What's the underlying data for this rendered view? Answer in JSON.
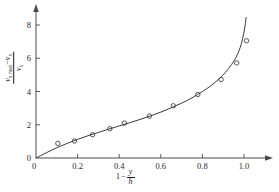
{
  "chart_data": {
    "type": "scatter",
    "title": "",
    "subtitle": "",
    "xlabel": "1 - y/h",
    "ylabel": "(v_x max - v_x) / v_x",
    "xlim": [
      0,
      1.12
    ],
    "ylim": [
      0,
      8.6
    ],
    "grid": false,
    "legend": null,
    "xticks": [
      0,
      0.2,
      0.4,
      0.6,
      0.8,
      1.0
    ],
    "xtick_labels": [
      "0",
      "0.2",
      "0.4",
      "0.6",
      "0.8",
      "1.0"
    ],
    "yticks": [
      0,
      2,
      4,
      6,
      8
    ],
    "ytick_labels": [
      "0",
      "2",
      "4",
      "6",
      "8"
    ],
    "series": [
      {
        "name": "measured data",
        "marker": "open-circle",
        "points": [
          [
            0.105,
            0.88
          ],
          [
            0.185,
            1.02
          ],
          [
            0.272,
            1.4
          ],
          [
            0.355,
            1.76
          ],
          [
            0.425,
            2.1
          ],
          [
            0.545,
            2.52
          ],
          [
            0.66,
            3.14
          ],
          [
            0.778,
            3.82
          ],
          [
            0.89,
            4.72
          ],
          [
            0.965,
            5.72
          ],
          [
            1.012,
            7.05
          ]
        ]
      },
      {
        "name": "fitted curve",
        "marker": "none",
        "points": [
          [
            0.0,
            0.0
          ],
          [
            0.05,
            0.32
          ],
          [
            0.1,
            0.62
          ],
          [
            0.15,
            0.88
          ],
          [
            0.2,
            1.12
          ],
          [
            0.25,
            1.34
          ],
          [
            0.3,
            1.54
          ],
          [
            0.35,
            1.74
          ],
          [
            0.4,
            1.93
          ],
          [
            0.45,
            2.12
          ],
          [
            0.5,
            2.32
          ],
          [
            0.55,
            2.53
          ],
          [
            0.6,
            2.76
          ],
          [
            0.65,
            3.02
          ],
          [
            0.7,
            3.3
          ],
          [
            0.75,
            3.62
          ],
          [
            0.8,
            4.0
          ],
          [
            0.84,
            4.34
          ],
          [
            0.88,
            4.76
          ],
          [
            0.91,
            5.14
          ],
          [
            0.94,
            5.62
          ],
          [
            0.96,
            6.02
          ],
          [
            0.975,
            6.42
          ],
          [
            0.988,
            6.9
          ],
          [
            0.998,
            7.45
          ],
          [
            1.005,
            7.95
          ],
          [
            1.01,
            8.45
          ]
        ]
      }
    ]
  },
  "axis_labels": {
    "y_numerator_v": "v",
    "y_numerator_sub1": "x max",
    "y_numerator_minus": "−",
    "y_numerator_v2": "v",
    "y_numerator_sub2": "x",
    "y_denominator_v": "v",
    "y_denominator_sub": "x",
    "x_prefix": "1",
    "x_minus": "−",
    "x_num": "y",
    "x_den": "h"
  },
  "style": {
    "axis_color": "#4a4a4a",
    "curve_color": "#3a3a3a",
    "marker_color": "#3a3a3a",
    "text_color": "#1a1a1a",
    "background": "#ffffff",
    "watermark_color": "#d8d8d8"
  },
  "watermark": {
    "line1": "",
    "line2": ""
  }
}
